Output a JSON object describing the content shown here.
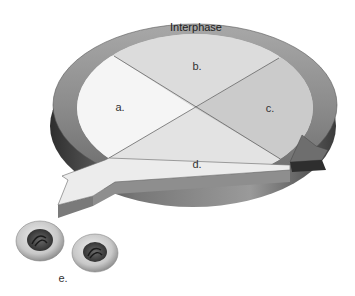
{
  "diagram": {
    "title": "Interphase",
    "segments": [
      {
        "id": "a",
        "label": "a.",
        "color": "#f4f4f4"
      },
      {
        "id": "b",
        "label": "b.",
        "color": "#dcdcdc"
      },
      {
        "id": "c",
        "label": "c.",
        "color": "#c8c8c8"
      },
      {
        "id": "d",
        "label": "d.",
        "color": "#e2e2e2"
      }
    ],
    "cells_label": "e.",
    "colors": {
      "ring": "#8a8a8a",
      "ring_dark": "#3a3a3a",
      "divider": "#555555",
      "cell_outer": "#d0d0d0",
      "cell_inner": "#4a4a4a"
    }
  }
}
